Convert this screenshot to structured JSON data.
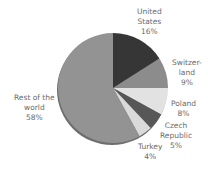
{
  "chart_data": {
    "type": "pie",
    "title": "",
    "start_angle_deg": 0,
    "direction": "clockwise",
    "slices": [
      {
        "label": "United States",
        "label_lines": [
          "United",
          "States"
        ],
        "value": 16,
        "value_label": "16%",
        "color": "#363636"
      },
      {
        "label": "Switzerland",
        "label_lines": [
          "Switzer-",
          "land"
        ],
        "value": 9,
        "value_label": "9%",
        "color": "#8c8c8c"
      },
      {
        "label": "Poland",
        "label_lines": [
          "Poland"
        ],
        "value": 8,
        "value_label": "8%",
        "color": "#e2e2e2"
      },
      {
        "label": "Czech Republic",
        "label_lines": [
          "Czech",
          "Republic"
        ],
        "value": 5,
        "value_label": "5%",
        "color": "#575757"
      },
      {
        "label": "Turkey",
        "label_lines": [
          "Turkey"
        ],
        "value": 4,
        "value_label": "4%",
        "color": "#dadada"
      },
      {
        "label": "Rest of the world",
        "label_lines": [
          "Rest of the",
          "world"
        ],
        "value": 58,
        "value_label": "58%",
        "color": "#939393"
      }
    ],
    "legend": "none",
    "edge_color": "#6e6e6e"
  }
}
